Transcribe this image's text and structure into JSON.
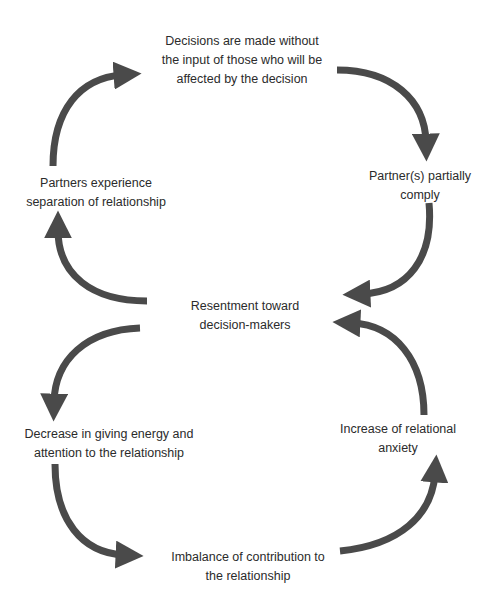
{
  "diagram": {
    "title": "",
    "arrow_color": "#4a4a4a",
    "text_color": "#2b2b2b",
    "nodes": [
      {
        "id": "decisions",
        "lines": [
          "Decisions are made without",
          "the input of those who will be",
          "affected by the decision"
        ]
      },
      {
        "id": "partial-comply",
        "lines": [
          "Partner(s) partially",
          "comply"
        ]
      },
      {
        "id": "resentment",
        "lines": [
          "Resentment toward",
          "decision-makers"
        ]
      },
      {
        "id": "separation",
        "lines": [
          "Partners experience",
          "separation of relationship"
        ]
      },
      {
        "id": "decrease-energy",
        "lines": [
          "Decrease in giving energy and",
          "attention to the relationship"
        ]
      },
      {
        "id": "imbalance",
        "lines": [
          "Imbalance of contribution to",
          "the relationship"
        ]
      },
      {
        "id": "anxiety",
        "lines": [
          "Increase of relational",
          "anxiety"
        ]
      }
    ],
    "edges": [
      {
        "from": "separation",
        "to": "decisions"
      },
      {
        "from": "decisions",
        "to": "partial-comply"
      },
      {
        "from": "partial-comply",
        "to": "resentment"
      },
      {
        "from": "resentment",
        "to": "separation"
      },
      {
        "from": "resentment",
        "to": "decrease-energy"
      },
      {
        "from": "decrease-energy",
        "to": "imbalance"
      },
      {
        "from": "imbalance",
        "to": "anxiety"
      },
      {
        "from": "anxiety",
        "to": "resentment"
      }
    ]
  }
}
